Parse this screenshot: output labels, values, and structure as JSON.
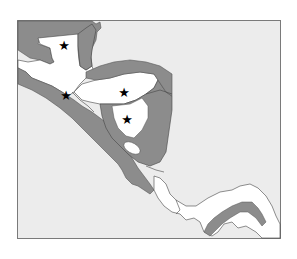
{
  "map": {
    "title": "Central America",
    "colors": {
      "sea": "#ececec",
      "land_shaded": "#8c8c8c",
      "land_highlight": "#ffffff",
      "border": "#444444",
      "frame": "#7a7a7a",
      "marker": "#000000"
    },
    "markers": [
      {
        "id": "star-1",
        "symbol": "★",
        "x": 64,
        "y": 46
      },
      {
        "id": "star-2",
        "symbol": "★",
        "x": 66,
        "y": 96
      },
      {
        "id": "star-3",
        "symbol": "★",
        "x": 124,
        "y": 93
      },
      {
        "id": "star-4",
        "symbol": "★",
        "x": 127,
        "y": 120
      }
    ]
  }
}
